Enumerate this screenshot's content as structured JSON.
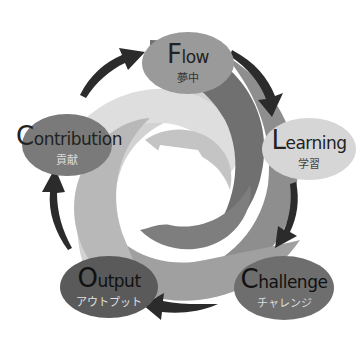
{
  "diagram": {
    "type": "cycle",
    "colors": {
      "background": "#ffffff",
      "arrow": "#2b2b2b",
      "swirl_dark": "#6a6a6a",
      "swirl_mid": "#8c8c8c",
      "swirl_light": "#b4b4b4",
      "swirl_lighter": "#c9c9c9",
      "swirl_lightest": "#dcdcdc"
    },
    "nodes": [
      {
        "id": "flow",
        "cap": "F",
        "rest": "low",
        "jp": "夢中",
        "fill": "#9a9a9a",
        "text_en": "#222222",
        "text_jp": "#333333"
      },
      {
        "id": "learning",
        "cap": "L",
        "rest": "earning",
        "jp": "学習",
        "fill": "#d6d6d6",
        "text_en": "#222222",
        "text_jp": "#444444"
      },
      {
        "id": "challenge",
        "cap": "C",
        "rest": "hallenge",
        "jp": "チャレンジ",
        "fill": "#6e6e6e",
        "text_en": "#111111",
        "text_jp": "#dddddd"
      },
      {
        "id": "output",
        "cap": "O",
        "rest": "utput",
        "jp": "アウトプット",
        "fill": "#5a5a5a",
        "text_en": "#111111",
        "text_jp": "#e0e0e0"
      },
      {
        "id": "contribution",
        "cap": "C",
        "rest": "ontribution",
        "jp": "貢献",
        "fill": "#7a7a7a",
        "text_en": "#222222",
        "text_jp": "#dddddd"
      }
    ]
  }
}
